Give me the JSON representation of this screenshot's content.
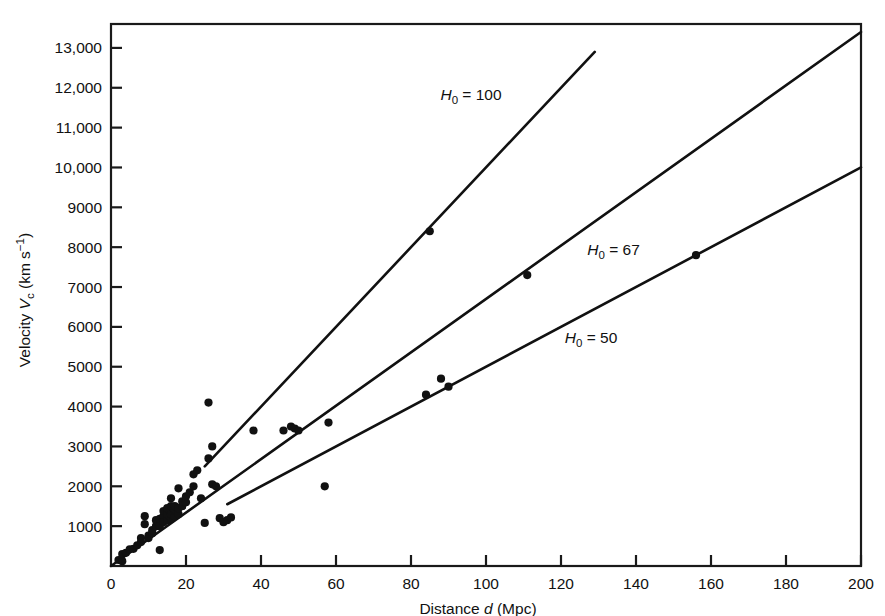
{
  "chart_data": {
    "type": "scatter",
    "title": "",
    "xlabel": "Distance d (Mpc)",
    "xlabel_parts": {
      "word": "Distance",
      "symbol": "d",
      "unit": "(Mpc)"
    },
    "ylabel": "Velocity Vc (km s-1)",
    "ylabel_parts": {
      "word": "Velocity",
      "symbol": "V",
      "sub": "c",
      "unit_open": "(km s",
      "unit_sup": "−1",
      "unit_close": ")"
    },
    "xlim": [
      0,
      200
    ],
    "ylim": [
      0,
      13600
    ],
    "xticks": [
      0,
      20,
      40,
      60,
      80,
      100,
      120,
      140,
      160,
      180,
      200
    ],
    "xticklabels": [
      "0",
      "20",
      "40",
      "60",
      "80",
      "100",
      "120",
      "140",
      "160",
      "180",
      "200"
    ],
    "yticks": [
      1000,
      2000,
      3000,
      4000,
      5000,
      6000,
      7000,
      8000,
      9000,
      10000,
      11000,
      12000,
      13000
    ],
    "yticklabels": [
      "1000",
      "2000",
      "3000",
      "4000",
      "5000",
      "6000",
      "7000",
      "8000",
      "9000",
      "10,000",
      "11,000",
      "12,000",
      "13,000"
    ],
    "grid": false,
    "legend": "none",
    "frame": "full-box",
    "tick_direction": "inward",
    "point_color": "#111111",
    "line_color": "#111111",
    "series": [
      {
        "name": "galaxies",
        "kind": "scatter",
        "points": [
          [
            2,
            150
          ],
          [
            3,
            120
          ],
          [
            3,
            300
          ],
          [
            4,
            330
          ],
          [
            5,
            420
          ],
          [
            6,
            430
          ],
          [
            7,
            520
          ],
          [
            8,
            600
          ],
          [
            8,
            700
          ],
          [
            9,
            1050
          ],
          [
            9,
            1250
          ],
          [
            10,
            760
          ],
          [
            10,
            700
          ],
          [
            11,
            820
          ],
          [
            11,
            900
          ],
          [
            12,
            1000
          ],
          [
            12,
            1150
          ],
          [
            13,
            400
          ],
          [
            13,
            1180
          ],
          [
            13,
            1000
          ],
          [
            14,
            1250
          ],
          [
            14,
            1380
          ],
          [
            14,
            1100
          ],
          [
            15,
            1150
          ],
          [
            15,
            1300
          ],
          [
            15,
            1450
          ],
          [
            16,
            1180
          ],
          [
            16,
            1300
          ],
          [
            16,
            1500
          ],
          [
            16,
            1700
          ],
          [
            17,
            1250
          ],
          [
            17,
            1380
          ],
          [
            17,
            1420
          ],
          [
            17,
            1500
          ],
          [
            18,
            1300
          ],
          [
            18,
            1450
          ],
          [
            18,
            1950
          ],
          [
            19,
            1500
          ],
          [
            19,
            1620
          ],
          [
            20,
            1600
          ],
          [
            20,
            1750
          ],
          [
            21,
            1850
          ],
          [
            22,
            2000
          ],
          [
            22,
            2300
          ],
          [
            23,
            2400
          ],
          [
            24,
            1700
          ],
          [
            25,
            1080
          ],
          [
            26,
            2700
          ],
          [
            26,
            4100
          ],
          [
            27,
            3000
          ],
          [
            27,
            2050
          ],
          [
            28,
            2000
          ],
          [
            29,
            1200
          ],
          [
            30,
            1100
          ],
          [
            31,
            1150
          ],
          [
            32,
            1220
          ],
          [
            38,
            3400
          ],
          [
            46,
            3400
          ],
          [
            48,
            3500
          ],
          [
            49,
            3450
          ],
          [
            50,
            3400
          ],
          [
            58,
            3600
          ],
          [
            57,
            2000
          ],
          [
            85,
            8400
          ],
          [
            84,
            4300
          ],
          [
            88,
            4700
          ],
          [
            90,
            4500
          ],
          [
            111,
            7300
          ],
          [
            156,
            7800
          ]
        ]
      },
      {
        "name": "H0 = 100",
        "kind": "line",
        "slope": 100,
        "label": "H0 = 100",
        "label_symbol": "H",
        "label_sub": "0",
        "label_value": "= 100",
        "x_start": 25,
        "x_end": 129,
        "label_x": 96,
        "label_y": 11700
      },
      {
        "name": "H0 = 67",
        "kind": "line",
        "slope": 67,
        "label": "H0 = 67",
        "label_symbol": "H",
        "label_sub": "0",
        "label_value": "= 67",
        "x_start": 0,
        "x_end": 200,
        "label_x": 134,
        "label_y": 7800
      },
      {
        "name": "H0 = 50",
        "kind": "line",
        "slope": 50,
        "label": "H0 = 50",
        "label_symbol": "H",
        "label_sub": "0",
        "label_value": "= 50",
        "x_start": 31,
        "x_end": 200,
        "label_x": 128,
        "label_y": 5600
      }
    ]
  }
}
